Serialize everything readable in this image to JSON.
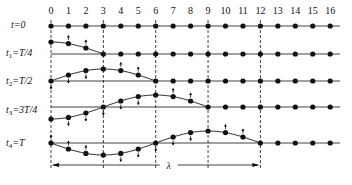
{
  "diagram": {
    "particle_indices": [
      "0",
      "1",
      "2",
      "3",
      "4",
      "5",
      "6",
      "7",
      "8",
      "9",
      "10",
      "11",
      "12",
      "13",
      "14",
      "15",
      "16"
    ],
    "rows": [
      {
        "label_main": "t",
        "label_sub": "",
        "label_rest": "=0",
        "phase": 0
      },
      {
        "label_main": "t",
        "label_sub": "1",
        "label_rest": "=T/4",
        "phase": 1
      },
      {
        "label_main": "t",
        "label_sub": "2",
        "label_rest": "=T/2",
        "phase": 2
      },
      {
        "label_main": "t",
        "label_sub": "3",
        "label_rest": "=3T/4",
        "phase": 3
      },
      {
        "label_main": "t",
        "label_sub": "4",
        "label_rest": "=T",
        "phase": 4
      }
    ],
    "wavelength_label": "λ",
    "dashed_guides_at_particles": [
      0,
      3,
      6,
      9,
      12
    ],
    "colors": {
      "ink": "#111111",
      "background": "#ffffff"
    }
  }
}
